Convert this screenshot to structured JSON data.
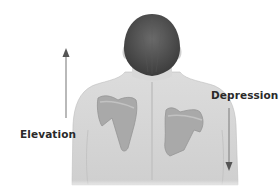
{
  "diagram": {
    "labels": {
      "elevation": "Elevation",
      "depression": "Depression"
    },
    "arrows": [
      {
        "name": "elevation-arrow",
        "direction": "up"
      },
      {
        "name": "depression-arrow",
        "direction": "down"
      }
    ],
    "colors": {
      "skin": "#d4d4d4",
      "scapula": "#a8a8a8",
      "hair": "#4a4a4a",
      "arrow": "#6e6e6e",
      "text": "#2a2a2a"
    }
  }
}
